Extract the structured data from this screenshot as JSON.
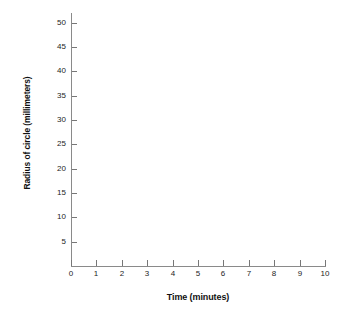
{
  "chart_data": {
    "type": "scatter",
    "title": "",
    "subtitle": "",
    "xlabel": "Time (minutes)",
    "ylabel": "Radius of circle (millimeters)",
    "xlim": [
      0,
      10
    ],
    "ylim": [
      0,
      52
    ],
    "x_ticks": [
      0,
      1,
      2,
      3,
      4,
      5,
      6,
      7,
      8,
      9,
      10
    ],
    "x_tick_labels": [
      "0",
      "1",
      "2",
      "3",
      "4",
      "5",
      "6",
      "7",
      "8",
      "9",
      "10"
    ],
    "y_ticks": [
      5,
      10,
      15,
      20,
      25,
      30,
      35,
      40,
      45,
      50
    ],
    "y_tick_labels": [
      "5",
      "10",
      "15",
      "20",
      "25",
      "30",
      "35",
      "40",
      "45",
      "50"
    ],
    "grid": false,
    "legend": false,
    "series": [],
    "x": [],
    "values": [],
    "annotations": [],
    "note": "Blank graph template: axes and labels only, no data plotted"
  },
  "axes": {
    "y_title": "Radius of circle (millimeters)",
    "x_title": "Time (minutes)"
  },
  "colors": {
    "background": "#ffffff",
    "axis_line": "#8a8a8a",
    "tick_mark": "#777777",
    "tick_label": "#242424",
    "axis_title": "#111111"
  }
}
